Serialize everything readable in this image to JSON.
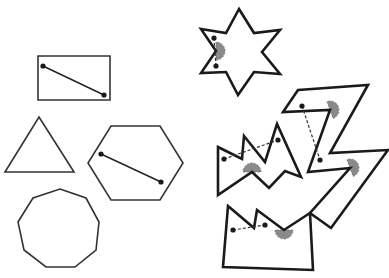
{
  "canvas": {
    "width": 389,
    "height": 278,
    "background": "#ffffff"
  },
  "colors": {
    "stroke": "#1a1a1a",
    "wedge_fill": "#8a8a8a"
  },
  "convex_shapes": [
    {
      "name": "rectangle",
      "points": "38,56 110,56 110,100 38,100",
      "diagonal": [
        [
          43,
          66
        ],
        [
          104,
          95
        ]
      ]
    },
    {
      "name": "triangle",
      "points": "39,117 74,172 5,172",
      "diagonal": null
    },
    {
      "name": "hexagon",
      "points": "111,126 160,126 183,163 160,200 111,200 88,163",
      "diagonal": [
        [
          101,
          154
        ],
        [
          161,
          182
        ]
      ]
    },
    {
      "name": "nonagon",
      "points": "60,189 86,198 99,222 96,250 75,267 46,267 24,250 18,222 33,198",
      "diagonal": null
    }
  ],
  "concave_shapes": [
    {
      "name": "star",
      "points": "239,9 254,33 280,30 262,52 280,74 254,72 238,95 226,72 201,73 216,51 201,29 226,33",
      "dots": [
        [
          214,
          38
        ],
        [
          216,
          66
        ]
      ],
      "wedges": [
        {
          "cx": 216,
          "cy": 51,
          "angle": 0
        }
      ]
    },
    {
      "name": "zigzag-z",
      "points": "298,90 368,85 330,153 388,150 331,228 310,213 350,168 308,172 330,110 283,112",
      "dots": [
        [
          302,
          106
        ],
        [
          320,
          160
        ]
      ],
      "wedges": [
        {
          "cx": 330,
          "cy": 110,
          "angle": -20
        },
        {
          "cx": 350,
          "cy": 168,
          "angle": -20
        }
      ]
    },
    {
      "name": "m-shape",
      "points": "218,147 242,159 244,136 265,162 277,124 301,177 285,171 269,188 252,172 218,195",
      "dots": [
        [
          224,
          159
        ],
        [
          278,
          140
        ]
      ],
      "wedges": [
        {
          "cx": 252,
          "cy": 172,
          "angle": -90
        }
      ]
    },
    {
      "name": "notched-box",
      "points": "228,206 254,228 257,210 284,230 310,213 313,270 223,267",
      "dots": [
        [
          233,
          230
        ],
        [
          265,
          225
        ]
      ],
      "wedges": [
        {
          "cx": 284,
          "cy": 230,
          "angle": 90
        }
      ]
    }
  ]
}
